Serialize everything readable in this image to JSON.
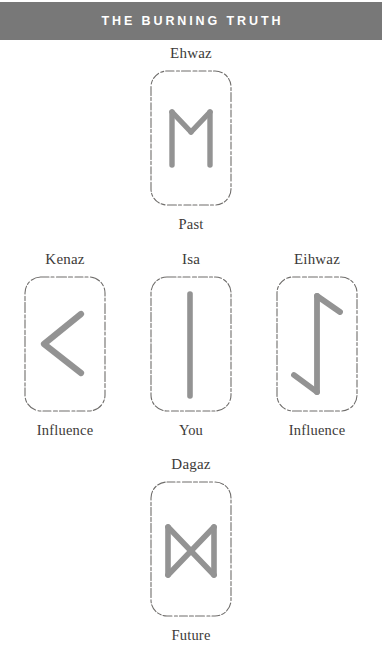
{
  "header": {
    "title": "THE BURNING TRUTH",
    "background_color": "#787878",
    "text_color": "#ffffff"
  },
  "theme": {
    "page_background": "#ffffff",
    "card_border_color": "#6f6d6b",
    "rune_stroke_color": "#8a8a8a",
    "label_color": "#3c3a38"
  },
  "spread": {
    "rows": [
      {
        "name": "past-row",
        "cards": [
          {
            "rune_name": "Ehwaz",
            "position_label": "Past",
            "glyph_id": "ehwaz-glyph"
          }
        ]
      },
      {
        "name": "middle-row",
        "cards": [
          {
            "rune_name": "Kenaz",
            "position_label": "Influence",
            "glyph_id": "kenaz-glyph"
          },
          {
            "rune_name": "Isa",
            "position_label": "You",
            "glyph_id": "isa-glyph"
          },
          {
            "rune_name": "Eihwaz",
            "position_label": "Influence",
            "glyph_id": "eihwaz-glyph"
          }
        ]
      },
      {
        "name": "future-row",
        "cards": [
          {
            "rune_name": "Dagaz",
            "position_label": "Future",
            "glyph_id": "dagaz-glyph"
          }
        ]
      }
    ]
  }
}
